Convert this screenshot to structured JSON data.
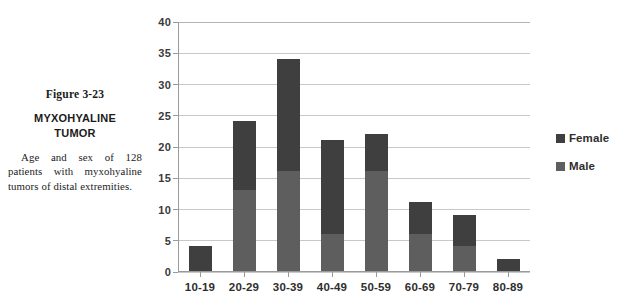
{
  "caption": {
    "figure_number": "Figure 3-23",
    "title_line_1": "MYXOHYALINE",
    "title_line_2": "TUMOR",
    "description": "Age and sex of 128 patients with myxohyaline tumors of distal extremities."
  },
  "legend": {
    "items": [
      {
        "label": "Female",
        "color": "#3f3f3f"
      },
      {
        "label": "Male",
        "color": "#5e5e5e"
      }
    ]
  },
  "chart_data": {
    "type": "bar",
    "title": "MYXOHYALINE TUMOR",
    "subtitle": "Age and sex of 128 patients with myxohyaline tumors of distal extremities.",
    "stacked": true,
    "orientation": "vertical",
    "xlabel": "",
    "ylabel": "",
    "ylim": [
      0,
      40
    ],
    "ytick_step": 5,
    "yticks": [
      0,
      5,
      10,
      15,
      20,
      25,
      30,
      35,
      40
    ],
    "ytick_labels": [
      "0",
      "5",
      "10",
      "15",
      "20",
      "25",
      "30",
      "35",
      "40"
    ],
    "grid": true,
    "grid_axis": "y",
    "legend_position": "right",
    "categories": [
      "10-19",
      "20-29",
      "30-39",
      "40-49",
      "50-59",
      "60-69",
      "70-79",
      "80-89"
    ],
    "series": [
      {
        "name": "Male",
        "color": "#5e5e5e",
        "stack_order": 0,
        "values": [
          0,
          13,
          16,
          6,
          16,
          6,
          4,
          0
        ]
      },
      {
        "name": "Female",
        "color": "#3f3f3f",
        "stack_order": 1,
        "values": [
          4,
          11,
          18,
          15,
          6,
          5,
          5,
          2
        ]
      }
    ],
    "totals": [
      4,
      24,
      34,
      21,
      22,
      11,
      9,
      2
    ],
    "grand_total": 128
  }
}
